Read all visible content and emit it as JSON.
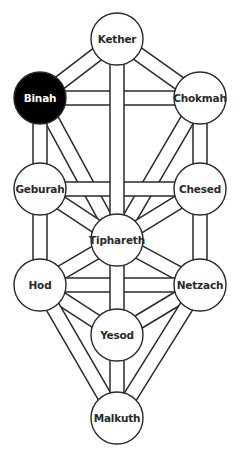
{
  "diagram": {
    "colors": {
      "background": "#ffffff",
      "line": "#2a2a2a",
      "node_fill": "#ffffff",
      "node_text": "#2a2a2a",
      "highlight_fill": "#000000",
      "highlight_text": "#ffffff"
    },
    "node_radius": 26,
    "highlighted": "binah",
    "nodes": [
      {
        "id": "kether",
        "label": "Kether",
        "x": 117,
        "y": 39
      },
      {
        "id": "binah",
        "label": "Binah",
        "x": 40,
        "y": 98
      },
      {
        "id": "chokmah",
        "label": "Chokmah",
        "x": 200,
        "y": 98
      },
      {
        "id": "geburah",
        "label": "Geburah",
        "x": 40,
        "y": 189
      },
      {
        "id": "chesed",
        "label": "Chesed",
        "x": 200,
        "y": 189
      },
      {
        "id": "tiphareth",
        "label": "Tiphareth",
        "x": 117,
        "y": 240
      },
      {
        "id": "hod",
        "label": "Hod",
        "x": 40,
        "y": 285
      },
      {
        "id": "netzach",
        "label": "Netzach",
        "x": 200,
        "y": 285
      },
      {
        "id": "yesod",
        "label": "Yesod",
        "x": 117,
        "y": 335
      },
      {
        "id": "malkuth",
        "label": "Malkuth",
        "x": 117,
        "y": 418
      }
    ],
    "paths": [
      [
        "kether",
        "chokmah"
      ],
      [
        "kether",
        "binah"
      ],
      [
        "chokmah",
        "binah"
      ],
      [
        "chokmah",
        "tiphareth"
      ],
      [
        "chokmah",
        "chesed"
      ],
      [
        "binah",
        "tiphareth"
      ],
      [
        "binah",
        "geburah"
      ],
      [
        "chesed",
        "geburah"
      ],
      [
        "chesed",
        "tiphareth"
      ],
      [
        "chesed",
        "netzach"
      ],
      [
        "geburah",
        "tiphareth"
      ],
      [
        "geburah",
        "hod"
      ],
      [
        "tiphareth",
        "netzach"
      ],
      [
        "tiphareth",
        "hod"
      ],
      [
        "netzach",
        "hod"
      ],
      [
        "netzach",
        "yesod"
      ],
      [
        "netzach",
        "malkuth"
      ],
      [
        "hod",
        "yesod"
      ],
      [
        "hod",
        "malkuth"
      ],
      [
        "kether",
        "tiphareth"
      ],
      [
        "tiphareth",
        "yesod"
      ],
      [
        "yesod",
        "malkuth"
      ]
    ]
  }
}
